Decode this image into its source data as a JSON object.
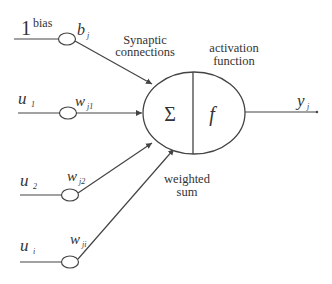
{
  "diagram": {
    "inputs": [
      {
        "value_main": "1",
        "value_sup": "bias",
        "weight_main": "b",
        "weight_sub": "j"
      },
      {
        "value_main": "u",
        "value_sub": "1",
        "weight_main": "w",
        "weight_sub": "j1"
      },
      {
        "value_main": "u",
        "value_sub": "2",
        "weight_main": "w",
        "weight_sub": "j2"
      },
      {
        "value_main": "u",
        "value_sub": "i",
        "weight_main": "w",
        "weight_sub": "ji"
      }
    ],
    "annotations": {
      "synaptic_line1": "Synaptic",
      "synaptic_line2": "connections",
      "activation_line1": "activation",
      "activation_line2": "function",
      "weighted_line1": "weighted",
      "weighted_line2": "sum"
    },
    "neuron": {
      "sum_symbol": "Σ",
      "activation_symbol": "f"
    },
    "output": {
      "main": "y",
      "sub": "j"
    },
    "colors": {
      "stroke": "#444444",
      "text": "#333333",
      "background": "#ffffff"
    }
  }
}
